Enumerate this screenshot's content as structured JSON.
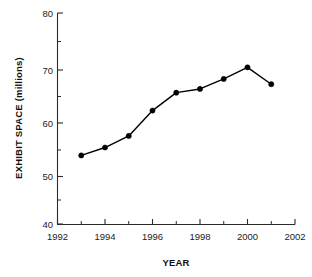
{
  "chart_data": {
    "type": "line",
    "title": "",
    "subtitle": "",
    "xlabel": "YEAR",
    "ylabel": "EXHIBIT SPACE (millions)",
    "x": [
      1993,
      1994,
      1995,
      1996,
      1997,
      1998,
      1999,
      2000,
      2001
    ],
    "values": [
      53.0,
      54.5,
      56.7,
      61.5,
      64.9,
      65.6,
      67.5,
      69.7,
      66.5
    ],
    "series": [
      {
        "name": "Exhibit space",
        "values": [
          53.0,
          54.5,
          56.7,
          61.5,
          64.9,
          65.6,
          67.5,
          69.7,
          66.5
        ]
      }
    ],
    "xlim": [
      1992,
      2002
    ],
    "ylim": [
      40,
      80
    ],
    "x_tick_labels": [
      "1992",
      "1994",
      "1996",
      "1998",
      "2000",
      "2002"
    ],
    "x_tick_values": [
      1992,
      1994,
      1996,
      1998,
      2000,
      2002
    ],
    "x_minor_tick_values": [
      1993,
      1995,
      1997,
      1999,
      2001
    ],
    "y_tick_labels": [
      "40",
      "50",
      "60",
      "70",
      "80"
    ],
    "y_tick_values": [
      40,
      50,
      60,
      70,
      80
    ],
    "y_minor_tick_values": [
      45,
      55,
      65,
      75
    ],
    "grid": false,
    "legend": false,
    "legend_position": "none",
    "marker": "filled-circle",
    "line_color": "#000000",
    "marker_color": "#000000",
    "background_color": "#ffffff"
  },
  "axes": {
    "y_axis_title": "EXHIBIT SPACE (millions)",
    "x_axis_title": "YEAR"
  }
}
